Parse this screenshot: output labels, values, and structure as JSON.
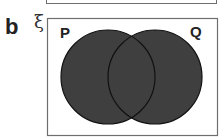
{
  "part_label": "b",
  "universal_set_symbol": "ξ",
  "sets": [
    {
      "name": "P",
      "cx": 108,
      "cy": 77,
      "r": 47
    },
    {
      "name": "Q",
      "cx": 155,
      "cy": 77,
      "r": 47
    }
  ],
  "shaded_region": "P ∪ Q",
  "colors": {
    "fill": "#3f3f3f",
    "stroke": "#111111",
    "frame": "#6e6e6e"
  }
}
